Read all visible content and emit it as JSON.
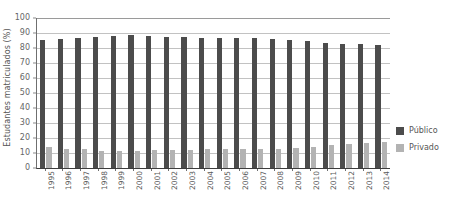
{
  "chart_data": {
    "type": "bar",
    "title": "",
    "subtitle": "",
    "xlabel": "",
    "ylabel": "Estudantes matriculados (%)",
    "ylim": [
      0,
      100
    ],
    "ytick_step": 10,
    "yticks": [
      0,
      10,
      20,
      30,
      40,
      50,
      60,
      70,
      80,
      90,
      100
    ],
    "grid": true,
    "grid_orientation": "horizontal",
    "legend_position": "right",
    "categories": [
      "1995",
      "1996",
      "1997",
      "1998",
      "1999",
      "2000",
      "2001",
      "2002",
      "2003",
      "2004",
      "2005",
      "2006",
      "2007",
      "2008",
      "2009",
      "2010",
      "2011",
      "2012",
      "2013",
      "2014"
    ],
    "series": [
      {
        "name": "Público",
        "color": "#4c4c4c",
        "values": [
          85.5,
          86.0,
          86.5,
          87.5,
          88.0,
          88.5,
          88.0,
          87.5,
          87.5,
          87.0,
          87.0,
          87.0,
          86.5,
          86.0,
          85.5,
          85.0,
          83.5,
          83.0,
          82.5,
          82.0
        ]
      },
      {
        "name": "Privado",
        "color": "#b3b3b3",
        "values": [
          14.0,
          13.0,
          12.5,
          11.5,
          11.5,
          11.5,
          12.0,
          12.0,
          12.0,
          12.5,
          12.5,
          12.5,
          12.5,
          13.0,
          13.5,
          14.0,
          15.5,
          16.0,
          17.0,
          17.5
        ]
      }
    ]
  },
  "legend": {
    "items": [
      {
        "label": "Público",
        "color": "#4c4c4c",
        "swatch": "legend-swatch-publico"
      },
      {
        "label": "Privado",
        "color": "#b3b3b3",
        "swatch": "legend-swatch-privado"
      }
    ]
  },
  "axis": {
    "y_title": "Estudantes matriculados (%)"
  },
  "colors": {
    "publico": "#4c4c4c",
    "privado": "#b3b3b3",
    "gridline": "#c2c2c2",
    "axis": "#3c3c3c",
    "text": "#555555",
    "background": "#ffffff"
  }
}
